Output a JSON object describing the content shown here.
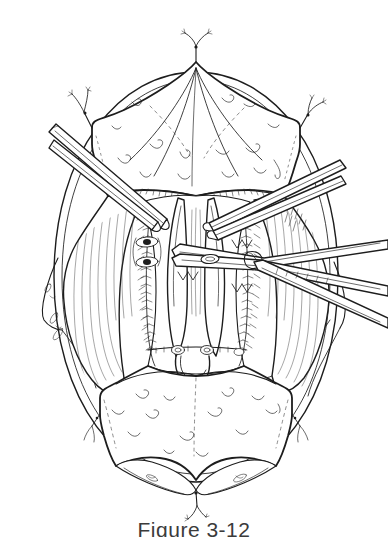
{
  "figure": {
    "caption": "Figure 3-12",
    "domain_kind": "line-art medical illustration",
    "background_color": "#ffffff",
    "ink_color": "#1d1d1d",
    "canvas": {
      "width": 388,
      "height": 533
    }
  },
  "elements": {
    "outer_oval_label": "retracted wound margin oval",
    "drape_top_label": "upper surgical drape flap",
    "drape_bottom_label": "lower surgical drape flap",
    "muscle_left_label": "left muscle belly with fiber hatching",
    "muscle_right_label": "right muscle belly with fiber hatching",
    "suture_line_left_label": "left running suture line",
    "suture_line_center_label": "center running suture line",
    "suture_line_right_label": "right running suture line",
    "loop_label": "central U-shaped suture loop",
    "instrument_upper_left_label": "upper-left clamp shaft",
    "instrument_upper_right_label": "upper-right clamp shaft",
    "instrument_lower_right_label": "lower-right forceps",
    "clamp_ring_label": "clamp ring handle",
    "apex_suture_label": "apex suture tie with tails",
    "corner_suture_left_label": "left corner suture tie",
    "corner_suture_right_label": "right corner suture tie",
    "bottom_suture_label": "bottom apex suture tie"
  }
}
